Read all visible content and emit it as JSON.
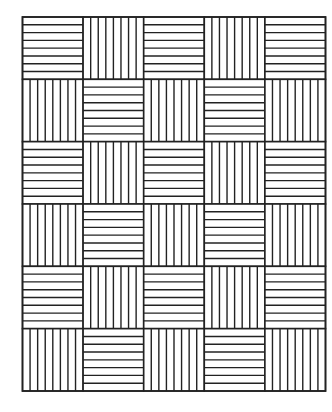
{
  "canvas": {
    "width": 332,
    "height": 412,
    "background": "#ffffff"
  },
  "pattern": {
    "name": "basket-weave-stripe-grid",
    "origin": {
      "x": 22.5,
      "y": 17
    },
    "size": {
      "width": 303,
      "height": 374
    },
    "rows": 6,
    "cols": 5,
    "stripes_per_cell": 8,
    "line_color": "#222222",
    "line_width": 1.4,
    "border_width": 1.6,
    "cells": [
      [
        "H",
        "V",
        "H",
        "V",
        "H"
      ],
      [
        "V",
        "H",
        "V",
        "H",
        "V"
      ],
      [
        "H",
        "V",
        "H",
        "V",
        "H"
      ],
      [
        "V",
        "H",
        "V",
        "H",
        "V"
      ],
      [
        "H",
        "V",
        "H",
        "V",
        "H"
      ],
      [
        "V",
        "H",
        "V",
        "H",
        "V"
      ]
    ],
    "legend": {
      "H": "horizontal-stripes",
      "V": "vertical-stripes"
    }
  }
}
